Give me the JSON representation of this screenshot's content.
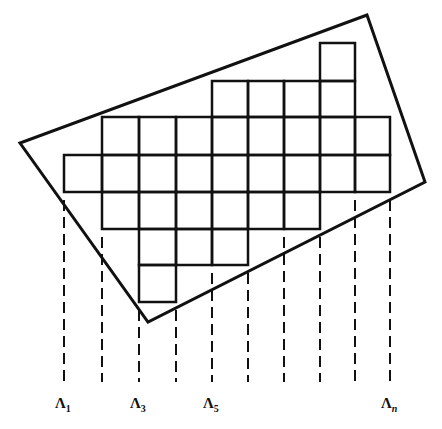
{
  "figure": {
    "type": "rotated-rectangle-over-pixel-grid",
    "stroke_color": "#111111",
    "background": "#ffffff",
    "quadrilateral": [
      [
        367,
        15
      ],
      [
        425,
        182
      ],
      [
        148,
        322
      ],
      [
        20,
        143
      ]
    ],
    "grid": {
      "x_lines": [
        64,
        102,
        139,
        176,
        212,
        248,
        284,
        320,
        355,
        390
      ],
      "y_lines": [
        43,
        81,
        117,
        155,
        192,
        229,
        265,
        302
      ],
      "rows": [
        {
          "row": 0,
          "cols": [
            7
          ]
        },
        {
          "row": 1,
          "cols": [
            4,
            5,
            6,
            7
          ]
        },
        {
          "row": 2,
          "cols": [
            1,
            2,
            3,
            4,
            5,
            6,
            7,
            8
          ]
        },
        {
          "row": 3,
          "cols": [
            0,
            1,
            2,
            3,
            4,
            5,
            6,
            7,
            8
          ]
        },
        {
          "row": 4,
          "cols": [
            1,
            2,
            3,
            4,
            5,
            6
          ]
        },
        {
          "row": 5,
          "cols": [
            2,
            3,
            4
          ]
        },
        {
          "row": 6,
          "cols": [
            2
          ]
        }
      ]
    },
    "projection_lines": {
      "x": [
        64,
        102,
        139,
        176,
        212,
        248,
        284,
        320,
        355,
        390
      ],
      "y_end": 382,
      "style": "dashed"
    },
    "labels": [
      {
        "base": "Λ",
        "sub": "1",
        "x": 64
      },
      {
        "base": "Λ",
        "sub": "3",
        "x": 139
      },
      {
        "base": "Λ",
        "sub": "5",
        "x": 212
      },
      {
        "base": "Λ",
        "sub": "n",
        "x": 390
      }
    ]
  }
}
